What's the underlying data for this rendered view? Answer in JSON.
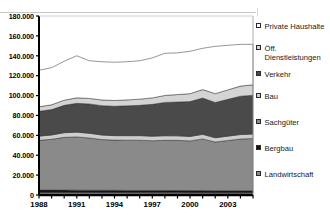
{
  "chart_data": {
    "type": "area",
    "stacked": true,
    "title": "",
    "xlabel": "",
    "ylabel": "",
    "ylim": [
      0,
      180000
    ],
    "ytick_labels": [
      "180.000",
      "160.000",
      "140.000",
      "120.000",
      "100.000",
      "80.000",
      "60.000",
      "40.000",
      "20.000",
      "0"
    ],
    "ytick_values": [
      180000,
      160000,
      140000,
      120000,
      100000,
      80000,
      60000,
      40000,
      20000,
      0
    ],
    "grid": false,
    "legend_position": "right",
    "x": [
      1988,
      1989,
      1990,
      1991,
      1992,
      1993,
      1994,
      1995,
      1996,
      1997,
      1998,
      1999,
      2000,
      2001,
      2002,
      2003,
      2004,
      2005
    ],
    "xtick_labels": [
      "1988",
      "1991",
      "1994",
      "1997",
      "2000",
      "2003"
    ],
    "xtick_values": [
      1988,
      1991,
      1994,
      1997,
      2000,
      2003
    ],
    "series": [
      {
        "name": "Landwirtschaft",
        "color": "#8c8c8c",
        "values": [
          2600,
          2600,
          2600,
          2550,
          2550,
          2500,
          2500,
          2450,
          2450,
          2400,
          2400,
          2400,
          2350,
          2350,
          2300,
          2300,
          2300,
          2300
        ]
      },
      {
        "name": "Bergbau",
        "color": "#141414",
        "values": [
          2400,
          2400,
          2350,
          2350,
          2300,
          2250,
          2200,
          2200,
          2150,
          2150,
          2100,
          2100,
          2050,
          2050,
          2000,
          2000,
          2000,
          2000
        ]
      },
      {
        "name": "Sachgüter",
        "color": "#8a8a8a",
        "values": [
          50000,
          51000,
          53000,
          53500,
          52500,
          51000,
          50500,
          50500,
          50500,
          50000,
          50500,
          50500,
          50000,
          52000,
          49000,
          50500,
          52000,
          52500
        ]
      },
      {
        "name": "Bau",
        "color": "#cdcdcd",
        "values": [
          4200,
          4400,
          4700,
          4800,
          4700,
          4600,
          4500,
          4500,
          4600,
          4600,
          4600,
          4500,
          4500,
          4600,
          4300,
          4400,
          4500,
          4500
        ]
      },
      {
        "name": "Verkehr",
        "color": "#4a4a4a",
        "values": [
          25000,
          25500,
          27500,
          29000,
          29500,
          29500,
          29500,
          30000,
          30500,
          32000,
          33500,
          34000,
          35000,
          36500,
          35500,
          37000,
          38500,
          39000
        ]
      },
      {
        "name": "Öff. Dienstleistungen",
        "color": "#d4d4d4",
        "values": [
          4500,
          4800,
          5200,
          5500,
          5600,
          5700,
          5800,
          6000,
          6200,
          6500,
          7000,
          7500,
          8000,
          8500,
          8800,
          9500,
          10200,
          10500
        ]
      },
      {
        "name": "Private Haushalte",
        "color": "#ffffff",
        "values": [
          36800,
          37300,
          39150,
          42300,
          37850,
          38450,
          38500,
          38350,
          38600,
          40200,
          42400,
          41900,
          42600,
          41500,
          47600,
          44800,
          42000,
          40700
        ]
      }
    ],
    "stack_tops": [
      125500,
      128000,
      134450,
      140000,
      135000,
      134000,
      133500,
      134000,
      135000,
      137850,
      142500,
      142900,
      144500,
      147500,
      149500,
      150500,
      151500,
      151500
    ]
  },
  "legend": {
    "items": [
      {
        "label": "Private Haushalte",
        "swatch": "#ffffff"
      },
      {
        "label": "Öff.\nDienstleistungen",
        "swatch": "#d4d4d4"
      },
      {
        "label": "Verkehr",
        "swatch": "#4a4a4a"
      },
      {
        "label": "Bau",
        "swatch": "#cdcdcd"
      },
      {
        "label": "Sachgüter",
        "swatch": "#8a8a8a"
      },
      {
        "label": "Bergbau",
        "swatch": "#141414"
      },
      {
        "label": "Landwirtschaft",
        "swatch": "#8c8c8c"
      }
    ]
  },
  "axis": {
    "axis_color": "#000000"
  }
}
